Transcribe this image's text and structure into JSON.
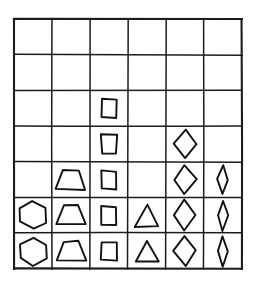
{
  "chart_data": {
    "type": "bar",
    "title": "",
    "subtitle": "",
    "xlabel": "",
    "ylabel": "",
    "grid": true,
    "legend_position": "none",
    "style": "hand-drawn pictogram bar chart",
    "axis_note": "counts read as number of filled cells stacked from bottom row upward",
    "ylim": [
      0,
      7
    ],
    "grid_columns": 6,
    "grid_rows": 7,
    "categories": [
      "hexagon",
      "trapezoid",
      "square",
      "triangle",
      "diamond",
      "narrow-diamond"
    ],
    "values": [
      2,
      3,
      5,
      2,
      4,
      3
    ],
    "series": [
      {
        "name": "shape count",
        "values": [
          2,
          3,
          5,
          2,
          4,
          3
        ]
      }
    ],
    "tick_labels_x": [
      "",
      "",
      "",
      "",
      "",
      ""
    ],
    "tick_labels_y": [
      "",
      "",
      "",
      "",
      "",
      "",
      ""
    ],
    "cells": [
      [
        "empty",
        "empty",
        "empty",
        "empty",
        "empty",
        "empty"
      ],
      [
        "empty",
        "empty",
        "empty",
        "empty",
        "empty",
        "empty"
      ],
      [
        "empty",
        "empty",
        "square",
        "empty",
        "empty",
        "empty"
      ],
      [
        "empty",
        "empty",
        "square",
        "empty",
        "diamond",
        "empty"
      ],
      [
        "empty",
        "trapezoid",
        "square",
        "empty",
        "diamond",
        "narrow-diamond"
      ],
      [
        "hexagon",
        "trapezoid",
        "square",
        "triangle",
        "diamond",
        "narrow-diamond"
      ],
      [
        "hexagon",
        "trapezoid",
        "square",
        "triangle",
        "diamond",
        "narrow-diamond"
      ]
    ]
  },
  "figure": {
    "caption": "",
    "ink_color": "#121212",
    "background_color": "#ffffff",
    "grid_line_color": "#1c1c1c"
  },
  "geometry": {
    "origin_x": 14,
    "origin_y": 19,
    "cell_width": 38,
    "cell_height": 35.7,
    "columns": 6,
    "rows": 7
  }
}
